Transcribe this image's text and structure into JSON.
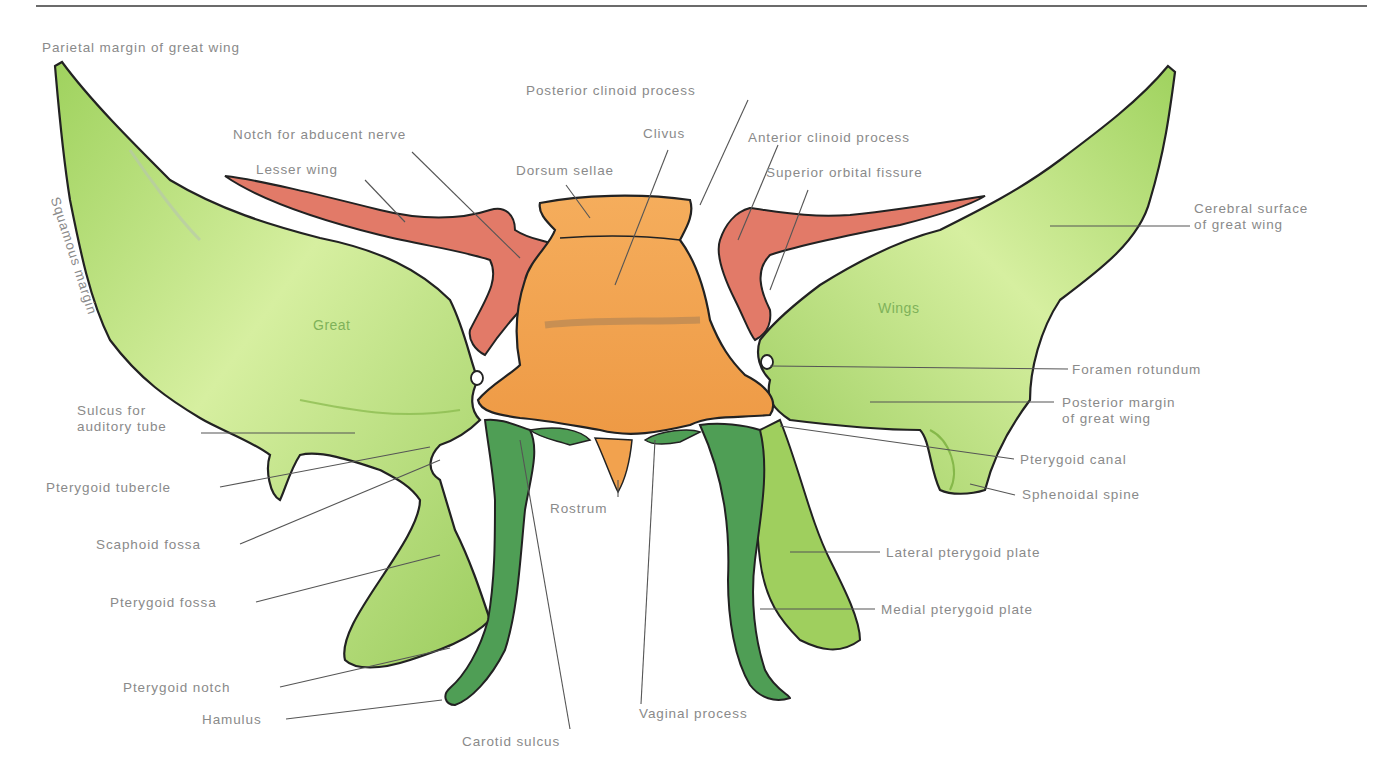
{
  "figure": {
    "colors": {
      "great_wing": "#a9d96a",
      "great_wing_light": "#d9f0a6",
      "lesser_wing": "#e27a68",
      "body": "#f2a24e",
      "body_dark": "#c9823a",
      "medial_plate": "#4f9e55",
      "outline": "#222222",
      "label_text": "#8a8a8a",
      "leader_line": "#555555",
      "top_rule": "#6b6b6b"
    },
    "inner_labels": {
      "great": "Great",
      "wings": "Wings"
    }
  },
  "labels": {
    "parietal_margin": "Parietal margin of great wing",
    "squamous_margin": "Squamous margin",
    "notch_abducent": "Notch for abducent nerve",
    "lesser_wing": "Lesser wing",
    "posterior_clinoid": "Posterior clinoid process",
    "clivus": "Clivus",
    "dorsum_sellae": "Dorsum sellae",
    "anterior_clinoid": "Anterior clinoid process",
    "superior_orbital_fissure": "Superior orbital fissure",
    "cerebral_surface_1": "Cerebral surface",
    "cerebral_surface_2": "of great wing",
    "foramen_rotundum": "Foramen rotundum",
    "posterior_margin_1": "Posterior margin",
    "posterior_margin_2": "of great wing",
    "pterygoid_canal": "Pterygoid canal",
    "sphenoidal_spine": "Sphenoidal spine",
    "lateral_pterygoid_plate": "Lateral pterygoid plate",
    "medial_pterygoid_plate": "Medial pterygoid plate",
    "sulcus_auditory_1": "Sulcus for",
    "sulcus_auditory_2": "auditory tube",
    "pterygoid_tubercle": "Pterygoid tubercle",
    "scaphoid_fossa": "Scaphoid fossa",
    "pterygoid_fossa": "Pterygoid fossa",
    "pterygoid_notch": "Pterygoid notch",
    "hamulus": "Hamulus",
    "carotid_sulcus": "Carotid sulcus",
    "rostrum": "Rostrum",
    "vaginal_process": "Vaginal process"
  }
}
